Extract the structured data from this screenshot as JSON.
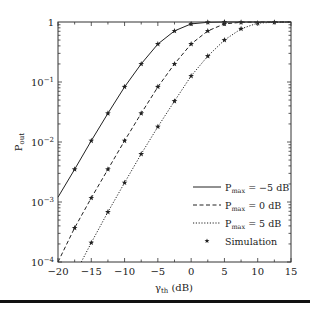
{
  "chart_data": {
    "type": "line",
    "title": "",
    "xlabel": "γth (dB)",
    "xlabel_main": "γ",
    "xlabel_sub": "th",
    "xlabel_unit": " (dB)",
    "ylabel": "Pout",
    "ylabel_main": "P",
    "ylabel_sub": "out",
    "yscale": "log",
    "xlim": [
      -20,
      15
    ],
    "ylim": [
      0.0001,
      1
    ],
    "x_ticks": [
      -20,
      -15,
      -10,
      -5,
      0,
      5,
      10,
      15
    ],
    "x_tick_labels": [
      "−20",
      "−15",
      "−10",
      "−5",
      "0",
      "5",
      "10",
      "15"
    ],
    "y_ticks": [
      0.0001,
      0.001,
      0.01,
      0.1,
      1
    ],
    "y_tick_labels": [
      {
        "base": "10",
        "exp": "−4"
      },
      {
        "base": "10",
        "exp": "−3"
      },
      {
        "base": "10",
        "exp": "−2"
      },
      {
        "base": "10",
        "exp": "−1"
      },
      {
        "base": "1",
        "exp": ""
      }
    ],
    "grid": false,
    "legend_position": "lower right",
    "series": [
      {
        "name": "Pmax = −5 dB",
        "legend_main": "P",
        "legend_sub": "max",
        "legend_rest": " = −5 dB",
        "style": "solid",
        "x": [
          -20,
          -17.5,
          -15,
          -12.5,
          -10,
          -7.5,
          -5,
          -2.5,
          0,
          2.5,
          5,
          7.5,
          10,
          12.5,
          15
        ],
        "y": [
          0.0012,
          0.0035,
          0.0105,
          0.03,
          0.083,
          0.2,
          0.43,
          0.71,
          0.93,
          0.99,
          1.0,
          1.0,
          1.0,
          1.0,
          1.0
        ]
      },
      {
        "name": "Pmax = 0 dB",
        "legend_main": "P",
        "legend_sub": "max",
        "legend_rest": " = 0 dB",
        "style": "dashed",
        "x": [
          -20,
          -17.5,
          -15,
          -12.5,
          -10,
          -7.5,
          -5,
          -2.5,
          0,
          2.5,
          5,
          7.5,
          10,
          12.5,
          15
        ],
        "y": [
          0.0001,
          0.00037,
          0.00117,
          0.0035,
          0.0105,
          0.03,
          0.083,
          0.2,
          0.43,
          0.71,
          0.93,
          0.99,
          1.0,
          1.0,
          1.0
        ]
      },
      {
        "name": "Pmax = 5 dB",
        "legend_main": "P",
        "legend_sub": "max",
        "legend_rest": " = 5 dB",
        "style": "dotted",
        "x": [
          -16.5,
          -15,
          -12.5,
          -10,
          -7.5,
          -5,
          -2.5,
          0,
          2.5,
          5,
          7.5,
          10,
          12.5,
          15
        ],
        "y": [
          0.0001,
          0.00021,
          0.00068,
          0.0021,
          0.0063,
          0.018,
          0.048,
          0.126,
          0.27,
          0.5,
          0.77,
          0.96,
          0.99,
          1.0
        ]
      }
    ],
    "simulation": {
      "name": "Simulation",
      "marker": "star",
      "points": [
        {
          "series": 0,
          "x": [
            -17.5,
            -15,
            -12.5,
            -10,
            -7.5,
            -5,
            -2.5,
            0,
            2.5,
            5
          ]
        },
        {
          "series": 1,
          "x": [
            -17.5,
            -15,
            -12.5,
            -10,
            -7.5,
            -5,
            -2.5,
            0,
            2.5,
            5,
            7.5
          ]
        },
        {
          "series": 2,
          "x": [
            -15,
            -12.5,
            -10,
            -7.5,
            -5,
            -2.5,
            0,
            2.5,
            5,
            7.5,
            10,
            12.5
          ]
        }
      ]
    }
  },
  "colors": {
    "line": "#222222",
    "axis": "#333333",
    "bottom_bar": "#111111"
  }
}
